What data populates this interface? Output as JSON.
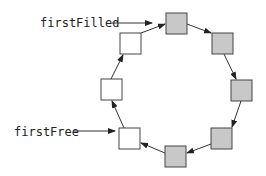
{
  "diagram": {
    "labels": {
      "first_filled": "firstFilled",
      "first_free": "firstFree"
    },
    "colors": {
      "filled": "#c8c8c8",
      "empty": "#ffffff",
      "stroke": "#444444"
    },
    "slots": [
      {
        "id": "slot-top",
        "x": 166,
        "y": 13,
        "filled": true
      },
      {
        "id": "slot-top-right",
        "x": 212,
        "y": 33,
        "filled": true
      },
      {
        "id": "slot-right",
        "x": 231,
        "y": 80,
        "filled": true
      },
      {
        "id": "slot-bottom-right",
        "x": 211,
        "y": 128,
        "filled": true
      },
      {
        "id": "slot-bottom",
        "x": 165,
        "y": 146,
        "filled": true
      },
      {
        "id": "slot-bottom-left",
        "x": 119,
        "y": 128,
        "filled": false
      },
      {
        "id": "slot-left",
        "x": 101,
        "y": 79,
        "filled": false
      },
      {
        "id": "slot-top-left",
        "x": 120,
        "y": 33,
        "filled": false
      }
    ]
  }
}
